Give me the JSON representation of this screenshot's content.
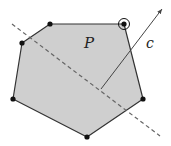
{
  "diagram": {
    "width": 171,
    "height": 146,
    "background": "#ffffff",
    "polygon": {
      "label": "P",
      "fill": "#cfcfcf",
      "stroke": "#333333",
      "vertices": [
        {
          "x": 50,
          "y": 24
        },
        {
          "x": 124,
          "y": 24
        },
        {
          "x": 143,
          "y": 99
        },
        {
          "x": 87,
          "y": 137
        },
        {
          "x": 13,
          "y": 99
        },
        {
          "x": 22,
          "y": 43
        }
      ],
      "highlighted_vertex_index": 1
    },
    "dashed_line": {
      "x1": 12,
      "y1": 24,
      "x2": 160,
      "y2": 136,
      "color": "#666666"
    },
    "vector": {
      "label": "c",
      "x1": 101,
      "y1": 89,
      "x2": 162,
      "y2": 9,
      "color": "#444444"
    },
    "labels": {
      "polygon_label": "P",
      "vector_label": "c"
    }
  }
}
